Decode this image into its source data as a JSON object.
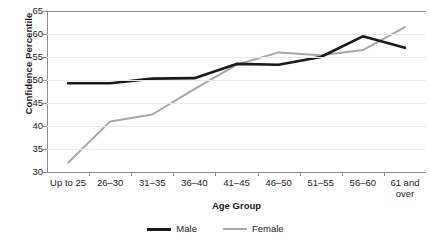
{
  "chart_data": {
    "type": "line",
    "title": "",
    "xlabel": "Age Group",
    "ylabel": "Confidence Percentile",
    "categories": [
      "Up to 25",
      "26–30",
      "31–35",
      "36–40",
      "41–45",
      "46–50",
      "51–55",
      "56–60",
      "61 and over"
    ],
    "series": [
      {
        "name": "Male",
        "color": "#1a1a1a",
        "values": [
          49.3,
          49.3,
          50.3,
          50.4,
          53.5,
          53.3,
          55.0,
          59.5,
          57.0
        ]
      },
      {
        "name": "Female",
        "color": "#a6a6a6",
        "values": [
          32.0,
          41.0,
          42.5,
          48.0,
          53.3,
          56.0,
          55.4,
          56.5,
          61.5
        ]
      }
    ],
    "ylim": [
      30,
      65
    ],
    "yticks": [
      30,
      35,
      40,
      45,
      50,
      55,
      60,
      65
    ],
    "ytick_labels": [
      "30",
      "35",
      "40",
      "45",
      "50",
      "55",
      "60",
      "65"
    ],
    "grid": true,
    "legend_position": "bottom"
  },
  "legend": {
    "entries": [
      {
        "label": "Male",
        "swatch": "male-line-swatch"
      },
      {
        "label": "Female",
        "swatch": "female-line-swatch"
      }
    ]
  }
}
